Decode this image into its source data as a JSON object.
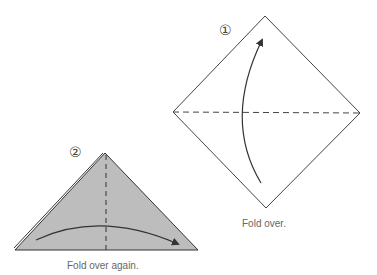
{
  "steps": [
    {
      "number": "①",
      "caption": "Fold over.",
      "instruction_arrow": "fold-up-arrow"
    },
    {
      "number": "②",
      "caption": "Fold over again.",
      "instruction_arrow": "fold-right-arrow"
    }
  ],
  "colors": {
    "line": "#333333",
    "fill_step2": "#bdbdbd",
    "caption": "#666666"
  }
}
